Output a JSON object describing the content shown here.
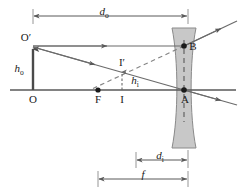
{
  "figure": {
    "type": "optics-ray-diagram",
    "background_color": "#ffffff",
    "line_color": "#595959",
    "label_color": "#1a1a1a",
    "lens_fill_color": "#c8c8c8",
    "lens_stroke_color": "#7a7a7a",
    "dashed_color": "#808080"
  },
  "labels": {
    "object_top": "O′",
    "object_base": "O",
    "focal_point": "F",
    "image_base": "I",
    "image_top": "I′",
    "lens_top_point": "B",
    "lens_center_point": "A",
    "object_height": {
      "symbol": "h",
      "subscript": "o"
    },
    "image_height": {
      "symbol": "h",
      "subscript": "i"
    },
    "object_distance": {
      "symbol": "d",
      "subscript": "o"
    },
    "image_distance": {
      "symbol": "d",
      "subscript": "i"
    },
    "focal_length": {
      "symbol": "f",
      "subscript": ""
    }
  },
  "dimensions": {
    "object_distance_line": {
      "label": "d_o",
      "x_start": 33,
      "x_end": 188,
      "y": 16
    },
    "image_distance_line": {
      "label": "d_i",
      "x_start": 136,
      "x_end": 188,
      "y": 160
    },
    "focal_length_line": {
      "label": "f",
      "x_start": 98,
      "x_end": 188,
      "y": 179
    }
  },
  "points": {
    "O": {
      "x": 33,
      "y": 90
    },
    "O_prime": {
      "x": 33,
      "y": 46
    },
    "F": {
      "x": 98,
      "y": 90
    },
    "I": {
      "x": 122,
      "y": 90
    },
    "I_prime": {
      "x": 122,
      "y": 70
    },
    "A": {
      "x": 184,
      "y": 90
    },
    "B": {
      "x": 184,
      "y": 46
    }
  },
  "axis": {
    "x_start": 10,
    "x_end": 236,
    "y": 90
  },
  "lens": {
    "top_y": 28,
    "bottom_y": 148,
    "outer_left_x": 172,
    "outer_right_x": 196,
    "waist_left_x": 180,
    "waist_right_x": 188
  }
}
